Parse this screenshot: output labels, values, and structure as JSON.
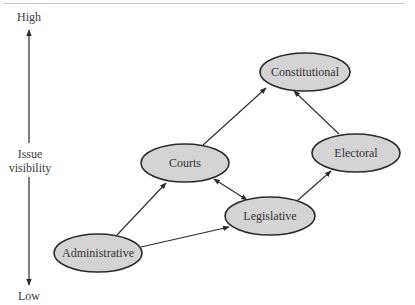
{
  "axis": {
    "high_label": "High",
    "low_label": "Low",
    "title_line1": "Issue",
    "title_line2": "visibility"
  },
  "nodes": {
    "constitutional": "Constitutional",
    "courts": "Courts",
    "electoral": "Electoral",
    "legislative": "Legislative",
    "administrative": "Administrative"
  },
  "edges": [
    {
      "from": "Administrative",
      "to": "Courts",
      "type": "directed"
    },
    {
      "from": "Administrative",
      "to": "Legislative",
      "type": "directed"
    },
    {
      "from": "Courts",
      "to": "Constitutional",
      "type": "directed"
    },
    {
      "from": "Courts",
      "to": "Legislative",
      "type": "bidirectional"
    },
    {
      "from": "Legislative",
      "to": "Electoral",
      "type": "directed"
    },
    {
      "from": "Electoral",
      "to": "Constitutional",
      "type": "directed"
    }
  ],
  "colors": {
    "node_fill": "#d4d4d4",
    "node_stroke": "#2a2a2a",
    "line": "#2a2a2a"
  }
}
